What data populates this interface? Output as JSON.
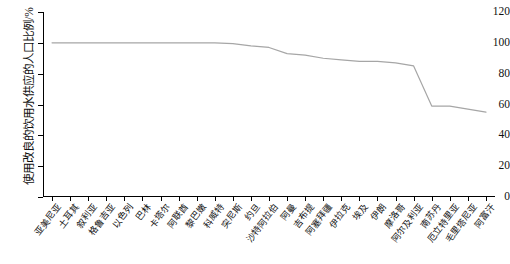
{
  "chart_data": {
    "type": "line",
    "title": "",
    "xlabel": "",
    "ylabel": "使用改良的饮用水供应的人口比例/%",
    "ylim": [
      0,
      120
    ],
    "yticks": [
      0,
      20,
      40,
      60,
      80,
      100,
      120
    ],
    "grid": false,
    "legend": "none",
    "line_color": "#a6a6a6",
    "categories": [
      "亚美尼亚",
      "土耳其",
      "叙利亚",
      "格鲁吉亚",
      "以色列",
      "巴林",
      "卡塔尔",
      "阿联酋",
      "黎巴嫩",
      "科威特",
      "突尼斯",
      "约旦",
      "沙特阿拉伯",
      "阿曼",
      "吉布提",
      "阿塞拜疆",
      "伊拉克",
      "埃及",
      "伊朗",
      "摩洛哥",
      "阿尔及利亚",
      "南苏丹",
      "厄立特里亚",
      "毛里塔尼亚",
      "阿富汗"
    ],
    "values": [
      100,
      100,
      100,
      100,
      100,
      100,
      100,
      100,
      100,
      100,
      99.5,
      98,
      97,
      93,
      92,
      90,
      89,
      88,
      88,
      87,
      85,
      59,
      59,
      57,
      55
    ]
  },
  "axis": {
    "y_unit_suffix": "%"
  }
}
